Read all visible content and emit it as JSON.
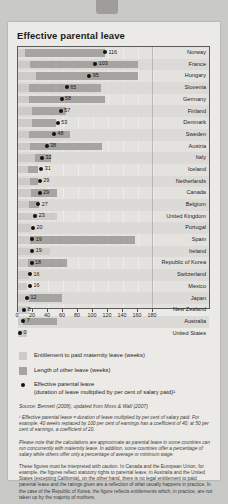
{
  "title": "Effective parental leave",
  "chart_data": {
    "type": "bar",
    "orientation": "horizontal",
    "title": "Effective parental leave",
    "xlabel": "",
    "ylabel": "",
    "xlim": [
      0,
      180
    ],
    "xticks": [
      0,
      20,
      40,
      60,
      80,
      100,
      120,
      140,
      160,
      180
    ],
    "grid": true,
    "legend_position": "below",
    "categories": [
      "Norway",
      "France",
      "Hungary",
      "Slovenia",
      "Germany",
      "Finland",
      "Denmark",
      "Sweden",
      "Austria",
      "Italy",
      "Iceland",
      "Netherlands",
      "Canada",
      "Belgium",
      "United Kingdom",
      "Portugal",
      "Spain",
      "Ireland",
      "Republic of Korea",
      "Switzerland",
      "Mexico",
      "Japan",
      "New Zealand",
      "Australia",
      "United States"
    ],
    "series": [
      {
        "name": "Entitlement to paid maternity leave (weeks)",
        "color": "#cdcbc7",
        "values": [
          9,
          16,
          24,
          15,
          14,
          18,
          18,
          14,
          16,
          22,
          13,
          16,
          17,
          15,
          52,
          17,
          16,
          42,
          13,
          14,
          12,
          14,
          14,
          6,
          12
        ]
      },
      {
        "name": "Length of other leave (weeks)",
        "color": "#a6a4a0",
        "values": [
          107,
          144,
          136,
          95,
          102,
          46,
          32,
          55,
          96,
          22,
          13,
          10,
          35,
          13,
          0,
          0,
          140,
          0,
          52,
          0,
          0,
          44,
          0,
          46,
          0
        ]
      },
      {
        "name": "Effective parental leave (duration of leave multiplied by per cent of salary paid)",
        "color": "#121212",
        "type": "scatter",
        "values": [
          116,
          103,
          95,
          65,
          58,
          57,
          53,
          48,
          38,
          32,
          31,
          29,
          29,
          27,
          23,
          20,
          19,
          19,
          18,
          16,
          16,
          12,
          8,
          7,
          0
        ]
      }
    ]
  },
  "legend": [
    {
      "label": "Entitlement to paid maternity leave (weeks)",
      "swatch": "a"
    },
    {
      "label": "Length of other leave (weeks)",
      "swatch": "b"
    },
    {
      "label": "Effective parental leave",
      "label2": "(duration of leave multiplied by per cent of salary paid)¹",
      "swatch": "dot"
    }
  ],
  "source": "Source: Bennett (2008), updated from Moss & Wall (2007)",
  "footnote": "¹ Effective parental leave = duration of leave multiplied by per cent of salary paid. For example, 40 weeks replaced by 100 per cent of earnings has a coefficient of 40; at 50 per cent of earnings, a coefficient of 20.",
  "note_italic": "Please note that the calculations are approximate as parental leave in some countries can run concurrently with maternity leave. In addition, some countries offer a percentage of salary while others offer only a percentage of average or minimum wage.",
  "note_plain": "These figures must be interpreted with caution. In Canada and the European Union, for example, the figures reflect statutory rights to parental leave; in Australia and the United States (excepting California), on the other hand, there is no legal entitlement to paid parental leave and the ratings given are a reflection of what usually happens in practice. In the case of the Republic of Korea, the figure reflects entitlements which, in practice, are not taken up by the majority of mothers."
}
